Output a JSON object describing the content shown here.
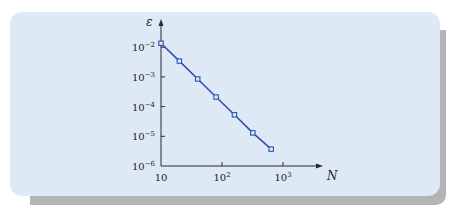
{
  "chart_data": {
    "type": "line",
    "title": "",
    "xlabel": "N",
    "ylabel": "ε",
    "xscale": "log",
    "yscale": "log",
    "xlim": [
      10,
      1000
    ],
    "ylim": [
      1e-06,
      0.02
    ],
    "grid": false,
    "x_ticks": [
      {
        "value": 10,
        "base": "10",
        "exp": ""
      },
      {
        "value": 100,
        "base": "10",
        "exp": "2"
      },
      {
        "value": 1000,
        "base": "10",
        "exp": "3"
      }
    ],
    "y_ticks": [
      {
        "value": 0.01,
        "base": "10",
        "exp": "−2"
      },
      {
        "value": 0.001,
        "base": "10",
        "exp": "−3"
      },
      {
        "value": 0.0001,
        "base": "10",
        "exp": "−4"
      },
      {
        "value": 1e-05,
        "base": "10",
        "exp": "−5"
      },
      {
        "value": 1e-06,
        "base": "10",
        "exp": "−6"
      }
    ],
    "series": [
      {
        "name": "error",
        "color": "#2e4fb3",
        "marker": "square",
        "x": [
          10,
          20,
          40,
          80,
          160,
          320,
          640
        ],
        "y": [
          0.0136,
          0.0034,
          0.00085,
          0.00021,
          5.3e-05,
          1.3e-05,
          3.7e-06
        ]
      }
    ]
  }
}
